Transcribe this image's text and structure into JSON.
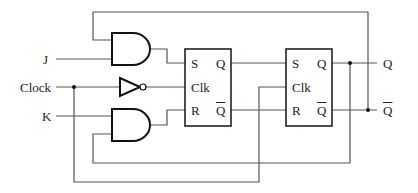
{
  "diagram": {
    "type": "JK flip-flop built from master-slave SR flip-flops",
    "inputs": [
      {
        "id": "J",
        "label": "J"
      },
      {
        "id": "Clock",
        "label": "Clock"
      },
      {
        "id": "K",
        "label": "K"
      }
    ],
    "outputs": [
      {
        "id": "Q",
        "label": "Q"
      },
      {
        "id": "Qbar",
        "label": "Q"
      }
    ],
    "flipflop1": {
      "s": "S",
      "clk": "Clk",
      "r": "R",
      "q": "Q",
      "qbar": "Q"
    },
    "flipflop2": {
      "s": "S",
      "clk": "Clk",
      "r": "R",
      "q": "Q",
      "qbar": "Q"
    },
    "gates": [
      "AND (upper)",
      "NOT (clock inverter)",
      "AND (lower)"
    ],
    "colors": {
      "wire": "#555555",
      "gate": "#111111",
      "background": "#ffffff"
    }
  }
}
